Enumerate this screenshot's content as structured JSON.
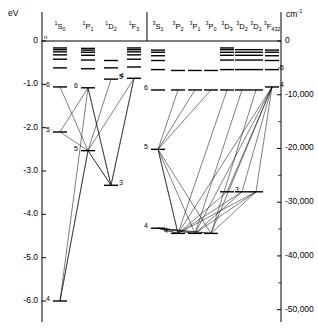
{
  "axes": {
    "left_unit": "eV",
    "right_unit_base": "cm",
    "right_unit_exp": "-1",
    "left_ticks": [
      "0",
      "-1.0",
      "-2.0",
      "-3.0",
      "-4.0",
      "-5.0",
      "-6.0"
    ],
    "left_tick_values": [
      0,
      -1.0,
      -2.0,
      -3.0,
      -4.0,
      -5.0,
      -6.0
    ],
    "right_ticks": [
      "0",
      "-10,000",
      "-20,000",
      "-30,000",
      "-40,000",
      "-50,000"
    ],
    "right_tick_values": [
      0,
      -10000,
      -20000,
      -30000,
      -40000,
      -50000
    ],
    "n_label": "n"
  },
  "columns": [
    {
      "id": "1S0",
      "mult": "1",
      "letter": "S",
      "j": "0",
      "x": 60
    },
    {
      "id": "1P1",
      "mult": "1",
      "letter": "P",
      "j": "1",
      "x": 88
    },
    {
      "id": "1D2",
      "mult": "1",
      "letter": "D",
      "j": "2",
      "x": 111
    },
    {
      "id": "1F3",
      "mult": "1",
      "letter": "F",
      "j": "3",
      "x": 134
    },
    {
      "id": "3S1",
      "mult": "3",
      "letter": "S",
      "j": "1",
      "x": 158
    },
    {
      "id": "3P2",
      "mult": "3",
      "letter": "P",
      "j": "2",
      "x": 178
    },
    {
      "id": "3P1",
      "mult": "3",
      "letter": "P",
      "j": "1",
      "x": 195
    },
    {
      "id": "3P0",
      "mult": "3",
      "letter": "P",
      "j": "0",
      "x": 211
    },
    {
      "id": "3D3",
      "mult": "3",
      "letter": "D",
      "j": "3",
      "x": 227
    },
    {
      "id": "3D2",
      "mult": "3",
      "letter": "D",
      "j": "2",
      "x": 242
    },
    {
      "id": "3D1",
      "mult": "3",
      "letter": "D",
      "j": "1",
      "x": 256
    },
    {
      "id": "3F432",
      "mult": "3",
      "letter": "F",
      "j": "4 3 2",
      "x": 272
    }
  ],
  "chart_data": {
    "type": "grotrian-energy-level",
    "title": "",
    "xlabel": "",
    "ylabel": "eV",
    "ylim": [
      -6.4,
      0.2
    ],
    "y2label": "cm-1",
    "y2lim": [
      -51600,
      1600
    ],
    "grid": false,
    "legend": "none",
    "levels": [
      {
        "col": "1S0",
        "n": "4",
        "ev": -6.0,
        "label": "4"
      },
      {
        "col": "1S0",
        "n": "5",
        "ev": -2.1,
        "label": "5"
      },
      {
        "col": "1S0",
        "n": "6",
        "ev": -1.06,
        "label": "6"
      },
      {
        "col": "1S0",
        "n": "7",
        "ev": -0.62,
        "label": ""
      },
      {
        "col": "1S0",
        "n": "8",
        "ev": -0.42,
        "label": ""
      },
      {
        "col": "1S0",
        "n": "9",
        "ev": -0.32,
        "label": ""
      },
      {
        "col": "1S0",
        "n": "10",
        "ev": -0.25,
        "label": ""
      },
      {
        "col": "1S0",
        "n": "11",
        "ev": -0.2,
        "label": ""
      },
      {
        "col": "1S0",
        "n": "12",
        "ev": -0.16,
        "label": ""
      },
      {
        "col": "1P1",
        "n": "5",
        "ev": -2.53,
        "label": "5"
      },
      {
        "col": "1P1",
        "n": "6",
        "ev": -1.08,
        "label": "6"
      },
      {
        "col": "1P1",
        "n": "7",
        "ev": -0.64,
        "label": ""
      },
      {
        "col": "1P1",
        "n": "8",
        "ev": -0.44,
        "label": ""
      },
      {
        "col": "1P1",
        "n": "9",
        "ev": -0.33,
        "label": ""
      },
      {
        "col": "1P1",
        "n": "10",
        "ev": -0.26,
        "label": ""
      },
      {
        "col": "1P1",
        "n": "11",
        "ev": -0.21,
        "label": ""
      },
      {
        "col": "1P1",
        "n": "12",
        "ev": -0.17,
        "label": ""
      },
      {
        "col": "1D2",
        "n": "3",
        "ev": -3.33,
        "label": "3"
      },
      {
        "col": "1D2",
        "n": "5",
        "ev": -0.88,
        "label": "5"
      },
      {
        "col": "1D2",
        "n": "6",
        "ev": -0.62,
        "label": ""
      },
      {
        "col": "1D2",
        "n": "7",
        "ev": -0.45,
        "label": ""
      },
      {
        "col": "1F3",
        "n": "4",
        "ev": -0.86,
        "label": "4"
      },
      {
        "col": "1F3",
        "n": "5",
        "ev": -0.6,
        "label": ""
      },
      {
        "col": "1F3",
        "n": "6",
        "ev": -0.42,
        "label": ""
      },
      {
        "col": "1F3",
        "n": "7",
        "ev": -0.32,
        "label": ""
      },
      {
        "col": "1F3",
        "n": "8",
        "ev": -0.25,
        "label": ""
      },
      {
        "col": "1F3",
        "n": "9",
        "ev": -0.2,
        "label": ""
      },
      {
        "col": "1F3",
        "n": "10",
        "ev": -0.16,
        "label": ""
      },
      {
        "col": "3S1",
        "n": "4",
        "ev": -4.32,
        "label": "4"
      },
      {
        "col": "3S1",
        "n": "5",
        "ev": -2.5,
        "label": "5"
      },
      {
        "col": "3S1",
        "n": "6",
        "ev": -1.13,
        "label": "6"
      },
      {
        "col": "3S1",
        "n": "7",
        "ev": -0.66,
        "label": ""
      },
      {
        "col": "3S1",
        "n": "8",
        "ev": -0.45,
        "label": ""
      },
      {
        "col": "3S1",
        "n": "9",
        "ev": -0.34,
        "label": ""
      },
      {
        "col": "3S1",
        "n": "10",
        "ev": -0.26,
        "label": ""
      },
      {
        "col": "3S1",
        "n": "11",
        "ev": -0.21,
        "label": ""
      },
      {
        "col": "3P2",
        "n": "4",
        "ev": -4.44,
        "label": "4"
      },
      {
        "col": "3P2",
        "n": "5",
        "ev": -1.13,
        "label": ""
      },
      {
        "col": "3P2",
        "n": "6",
        "ev": -0.68,
        "label": ""
      },
      {
        "col": "3P1",
        "n": "4",
        "ev": -4.44,
        "label": ""
      },
      {
        "col": "3P1",
        "n": "5",
        "ev": -1.13,
        "label": ""
      },
      {
        "col": "3P1",
        "n": "6",
        "ev": -0.68,
        "label": ""
      },
      {
        "col": "3P0",
        "n": "4",
        "ev": -4.44,
        "label": ""
      },
      {
        "col": "3P0",
        "n": "5",
        "ev": -1.13,
        "label": ""
      },
      {
        "col": "3P0",
        "n": "6",
        "ev": -0.68,
        "label": ""
      },
      {
        "col": "3D3",
        "n": "3",
        "ev": -3.48,
        "label": "3"
      },
      {
        "col": "3D3",
        "n": "4",
        "ev": -1.13,
        "label": ""
      },
      {
        "col": "3D3",
        "n": "5",
        "ev": -0.66,
        "label": ""
      },
      {
        "col": "3D3",
        "n": "6",
        "ev": -0.44,
        "label": ""
      },
      {
        "col": "3D3",
        "n": "7",
        "ev": -0.33,
        "label": ""
      },
      {
        "col": "3D3",
        "n": "8",
        "ev": -0.26,
        "label": ""
      },
      {
        "col": "3D3",
        "n": "9",
        "ev": -0.2,
        "label": ""
      },
      {
        "col": "3D3",
        "n": "10",
        "ev": -0.16,
        "label": ""
      },
      {
        "col": "3D2",
        "n": "3",
        "ev": -3.48,
        "label": ""
      },
      {
        "col": "3D2",
        "n": "4",
        "ev": -1.13,
        "label": ""
      },
      {
        "col": "3D2",
        "n": "5",
        "ev": -0.66,
        "label": ""
      },
      {
        "col": "3D2",
        "n": "6",
        "ev": -0.44,
        "label": ""
      },
      {
        "col": "3D2",
        "n": "7",
        "ev": -0.33,
        "label": ""
      },
      {
        "col": "3D2",
        "n": "8",
        "ev": -0.26,
        "label": ""
      },
      {
        "col": "3D2",
        "n": "9",
        "ev": -0.2,
        "label": ""
      },
      {
        "col": "3D1",
        "n": "3",
        "ev": -3.48,
        "label": ""
      },
      {
        "col": "3D1",
        "n": "4",
        "ev": -1.13,
        "label": ""
      },
      {
        "col": "3D1",
        "n": "5",
        "ev": -0.66,
        "label": ""
      },
      {
        "col": "3D1",
        "n": "6",
        "ev": -0.44,
        "label": ""
      },
      {
        "col": "3D1",
        "n": "7",
        "ev": -0.33,
        "label": ""
      },
      {
        "col": "3D1",
        "n": "8",
        "ev": -0.26,
        "label": ""
      },
      {
        "col": "3D1",
        "n": "9",
        "ev": -0.2,
        "label": ""
      },
      {
        "col": "3F432",
        "n": "4",
        "ev": -1.06,
        "label": "4"
      },
      {
        "col": "3F432",
        "n": "5",
        "ev": -0.66,
        "label": "5"
      },
      {
        "col": "3F432",
        "n": "6",
        "ev": -0.45,
        "label": ""
      },
      {
        "col": "3F432",
        "n": "7",
        "ev": -0.34,
        "label": ""
      },
      {
        "col": "3F432",
        "n": "8",
        "ev": -0.26,
        "label": ""
      },
      {
        "col": "3F432",
        "n": "9",
        "ev": -0.21,
        "label": ""
      }
    ],
    "transitions": [
      {
        "from": [
          "1S0",
          "4"
        ],
        "to": [
          "1P1",
          "5"
        ]
      },
      {
        "from": [
          "1S0",
          "4"
        ],
        "to": [
          "1P1",
          "6"
        ]
      },
      {
        "from": [
          "1S0",
          "5"
        ],
        "to": [
          "1P1",
          "5"
        ]
      },
      {
        "from": [
          "1S0",
          "5"
        ],
        "to": [
          "1P1",
          "6"
        ]
      },
      {
        "from": [
          "1S0",
          "6"
        ],
        "to": [
          "1P1",
          "5"
        ]
      },
      {
        "from": [
          "1P1",
          "5"
        ],
        "to": [
          "1S0",
          "4"
        ]
      },
      {
        "from": [
          "1P1",
          "5"
        ],
        "to": [
          "1D2",
          "3"
        ]
      },
      {
        "from": [
          "1P1",
          "6"
        ],
        "to": [
          "1D2",
          "3"
        ]
      },
      {
        "from": [
          "1P1",
          "5"
        ],
        "to": [
          "1F3",
          "4"
        ]
      },
      {
        "from": [
          "1D2",
          "3"
        ],
        "to": [
          "1P1",
          "5"
        ]
      },
      {
        "from": [
          "1D2",
          "3"
        ],
        "to": [
          "1P1",
          "6"
        ]
      },
      {
        "from": [
          "1D2",
          "3"
        ],
        "to": [
          "1F3",
          "4"
        ]
      },
      {
        "from": [
          "1D2",
          "5"
        ],
        "to": [
          "1P1",
          "5"
        ]
      },
      {
        "from": [
          "1F3",
          "4"
        ],
        "to": [
          "1D2",
          "3"
        ]
      },
      {
        "from": [
          "3S1",
          "4"
        ],
        "to": [
          "3P2",
          "4"
        ]
      },
      {
        "from": [
          "3S1",
          "4"
        ],
        "to": [
          "3P1",
          "4"
        ]
      },
      {
        "from": [
          "3S1",
          "4"
        ],
        "to": [
          "3P0",
          "4"
        ]
      },
      {
        "from": [
          "3S1",
          "5"
        ],
        "to": [
          "3P2",
          "4"
        ]
      },
      {
        "from": [
          "3S1",
          "5"
        ],
        "to": [
          "3P1",
          "4"
        ]
      },
      {
        "from": [
          "3S1",
          "5"
        ],
        "to": [
          "3P0",
          "4"
        ]
      },
      {
        "from": [
          "3P2",
          "4"
        ],
        "to": [
          "3S1",
          "5"
        ]
      },
      {
        "from": [
          "3P2",
          "4"
        ],
        "to": [
          "3D3",
          "3"
        ]
      },
      {
        "from": [
          "3P2",
          "4"
        ],
        "to": [
          "3D2",
          "3"
        ]
      },
      {
        "from": [
          "3P2",
          "4"
        ],
        "to": [
          "3D1",
          "3"
        ]
      },
      {
        "from": [
          "3P1",
          "4"
        ],
        "to": [
          "3D2",
          "3"
        ]
      },
      {
        "from": [
          "3P1",
          "4"
        ],
        "to": [
          "3D1",
          "3"
        ]
      },
      {
        "from": [
          "3P0",
          "4"
        ],
        "to": [
          "3D1",
          "3"
        ]
      },
      {
        "from": [
          "3P2",
          "4"
        ],
        "to": [
          "3D3",
          "4"
        ]
      },
      {
        "from": [
          "3P1",
          "4"
        ],
        "to": [
          "3D2",
          "4"
        ]
      },
      {
        "from": [
          "3P0",
          "4"
        ],
        "to": [
          "3D1",
          "4"
        ]
      },
      {
        "from": [
          "3D3",
          "3"
        ],
        "to": [
          "3F432",
          "4"
        ]
      },
      {
        "from": [
          "3D2",
          "3"
        ],
        "to": [
          "3F432",
          "4"
        ]
      },
      {
        "from": [
          "3D1",
          "3"
        ],
        "to": [
          "3F432",
          "4"
        ]
      },
      {
        "from": [
          "3P2",
          "4"
        ],
        "to": [
          "3F432",
          "4"
        ]
      },
      {
        "from": [
          "3P1",
          "4"
        ],
        "to": [
          "3F432",
          "4"
        ]
      },
      {
        "from": [
          "3P0",
          "4"
        ],
        "to": [
          "3F432",
          "4"
        ]
      },
      {
        "from": [
          "3S1",
          "5"
        ],
        "to": [
          "3P2",
          "5"
        ]
      },
      {
        "from": [
          "3S1",
          "5"
        ],
        "to": [
          "3P1",
          "5"
        ]
      },
      {
        "from": [
          "3S1",
          "5"
        ],
        "to": [
          "3P0",
          "5"
        ]
      },
      {
        "from": [
          "3P2",
          "4"
        ],
        "to": [
          "3S1",
          "4"
        ]
      },
      {
        "from": [
          "3P1",
          "4"
        ],
        "to": [
          "3S1",
          "4"
        ]
      },
      {
        "from": [
          "3P0",
          "4"
        ],
        "to": [
          "3S1",
          "4"
        ]
      }
    ]
  }
}
